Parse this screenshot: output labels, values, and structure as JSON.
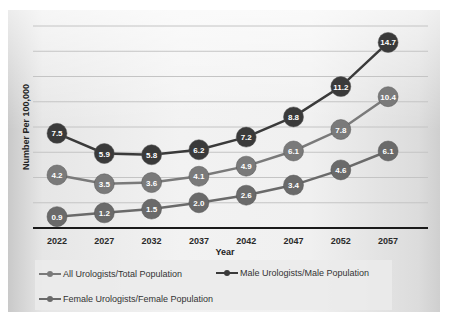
{
  "chart_data": {
    "type": "line",
    "title": "",
    "xlabel": "Year",
    "ylabel": "Number Per 100,000",
    "categories": [
      "2022",
      "2027",
      "2032",
      "2037",
      "2042",
      "2047",
      "2052",
      "2057"
    ],
    "ylim": [
      0,
      16
    ],
    "grid": true,
    "legend_position": "bottom",
    "series": [
      {
        "name": "All Urologists/Total Population",
        "color": "#7a7a7a",
        "values": [
          4.2,
          3.5,
          3.6,
          4.1,
          4.9,
          6.1,
          7.8,
          10.4
        ]
      },
      {
        "name": "Male Urologists/Male Population",
        "color": "#3a3a3a",
        "values": [
          7.5,
          5.9,
          5.8,
          6.2,
          7.2,
          8.8,
          11.2,
          14.7
        ]
      },
      {
        "name": "Female Urologists/Female Population",
        "color": "#6a6a6a",
        "values": [
          0.9,
          1.2,
          1.5,
          2.0,
          2.6,
          3.4,
          4.6,
          6.1
        ]
      }
    ]
  },
  "axis": {
    "x_title": "Year",
    "y_title": "Number Per 100,000",
    "x_ticks": [
      "2022",
      "2027",
      "2032",
      "2037",
      "2042",
      "2047",
      "2052",
      "2057"
    ]
  },
  "legend": {
    "items": [
      {
        "label": "All Urologists/Total Population",
        "color": "#7a7a7a"
      },
      {
        "label": "Male Urologists/Male Population",
        "color": "#3a3a3a"
      },
      {
        "label": "Female Urologists/Female Population",
        "color": "#6a6a6a"
      }
    ]
  }
}
